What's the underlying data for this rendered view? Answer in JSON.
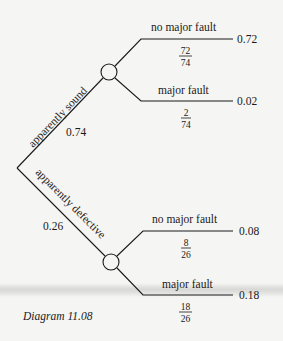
{
  "diagram": {
    "type": "probability-tree",
    "caption": "Diagram 11.08",
    "root": {
      "branches": [
        {
          "label": "apparently sound",
          "probability": "0.74",
          "children": [
            {
              "label": "no major fault",
              "fraction_num": "72",
              "fraction_den": "74",
              "joint": "0.72"
            },
            {
              "label": "major fault",
              "fraction_num": "2",
              "fraction_den": "74",
              "joint": "0.02"
            }
          ]
        },
        {
          "label": "apparently defective",
          "probability": "0.26",
          "children": [
            {
              "label": "no major fault",
              "fraction_num": "8",
              "fraction_den": "26",
              "joint": "0.08"
            },
            {
              "label": "major fault",
              "fraction_num": "18",
              "fraction_den": "26",
              "joint": "0.18"
            }
          ]
        }
      ]
    }
  }
}
